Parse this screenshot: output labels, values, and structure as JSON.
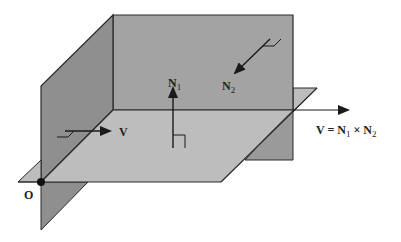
{
  "diagram": {
    "colors": {
      "wall_dark": "#8f8f8f",
      "wall_rear": "#a3a3a3",
      "horizontal_plane": "#bdbdbd",
      "edge": "#2a2a2a",
      "arrow": "#1a1a1a"
    },
    "labels": {
      "n1": "N",
      "n1_sub": "1",
      "n2": "N",
      "n2_sub": "2",
      "v_small": "V",
      "origin": "O",
      "formula_v": "V = N",
      "formula_n1_sub": "1",
      "formula_times": " × N",
      "formula_n2_sub": "2"
    }
  }
}
